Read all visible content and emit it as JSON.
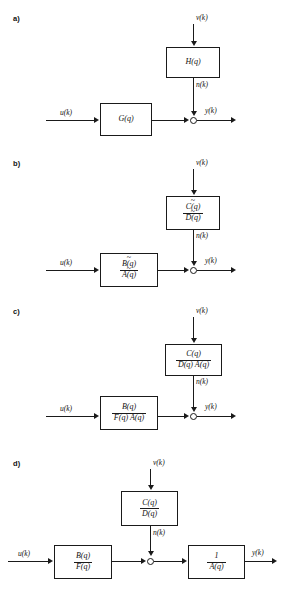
{
  "figure": {
    "signals": {
      "input": "u(k)",
      "disturbance": "v(k)",
      "noise": "n(k)",
      "output": "y(k)"
    },
    "colors": {
      "line": "#1a1a1a",
      "background": "#ffffff",
      "text": "#111111"
    }
  },
  "panels": [
    {
      "label": "a)",
      "blocks": [
        {
          "name": "noise-filter",
          "type": "plain",
          "text": "H(q)"
        },
        {
          "name": "process-model",
          "type": "plain",
          "text": "G(q)"
        }
      ],
      "signals": {
        "input": "u(k)",
        "disturbance": "v(k)",
        "noise": "n(k)",
        "output": "y(k)"
      }
    },
    {
      "label": "b)",
      "blocks": [
        {
          "name": "noise-filter",
          "type": "fraction",
          "numerator": "C(q)",
          "denominator": "D(q)",
          "tilde": true
        },
        {
          "name": "process-model",
          "type": "fraction",
          "numerator": "B(q)",
          "denominator": "A(q)",
          "tilde": true
        }
      ],
      "signals": {
        "input": "u(k)",
        "disturbance": "v(k)",
        "noise": "n(k)",
        "output": "y(k)"
      }
    },
    {
      "label": "c)",
      "blocks": [
        {
          "name": "noise-filter",
          "type": "fraction",
          "numerator": "C(q)",
          "denominator": "D(q) A(q)",
          "tilde": false
        },
        {
          "name": "process-model",
          "type": "fraction",
          "numerator": "B(q)",
          "denominator": "F(q) A(q)",
          "tilde": false
        }
      ],
      "signals": {
        "input": "u(k)",
        "disturbance": "v(k)",
        "noise": "n(k)",
        "output": "y(k)"
      }
    },
    {
      "label": "d)",
      "blocks": [
        {
          "name": "noise-filter",
          "type": "fraction",
          "numerator": "C(q)",
          "denominator": "D(q)",
          "tilde": false
        },
        {
          "name": "process-model",
          "type": "fraction",
          "numerator": "B(q)",
          "denominator": "F(q)",
          "tilde": false
        },
        {
          "name": "output-filter",
          "type": "fraction",
          "numerator": "1",
          "denominator": "A(q)",
          "tilde": false
        }
      ],
      "signals": {
        "input": "u(k)",
        "disturbance": "v(k)",
        "noise": "n(k)",
        "output": "y(k)"
      }
    }
  ]
}
